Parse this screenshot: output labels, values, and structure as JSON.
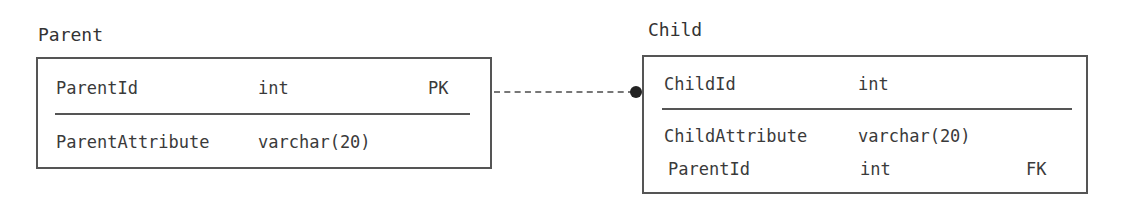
{
  "diagram": {
    "type": "ER diagram",
    "entities": [
      {
        "name": "Parent",
        "key_attributes": [
          {
            "name": "ParentId",
            "type": "int",
            "key": "PK"
          }
        ],
        "attributes": [
          {
            "name": "ParentAttribute",
            "type": "varchar(20)",
            "key": ""
          }
        ]
      },
      {
        "name": "Child",
        "key_attributes": [
          {
            "name": "ChildId",
            "type": "int",
            "key": ""
          }
        ],
        "attributes": [
          {
            "name": "ChildAttribute",
            "type": "varchar(20)",
            "key": ""
          },
          {
            "name": "ParentId",
            "type": "int",
            "key": "FK"
          }
        ]
      }
    ],
    "relationships": [
      {
        "from": "Parent",
        "to": "Child",
        "line_style": "dashed",
        "end_marker": "filled-circle (many)"
      }
    ]
  }
}
